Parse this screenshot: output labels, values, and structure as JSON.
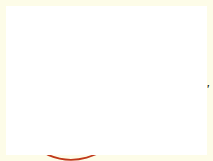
{
  "figure": {
    "kind": "geometry-diagram",
    "background_color": "#ffffff",
    "frame_color": "#fdfce8"
  },
  "colors": {
    "axis": "#9a9a9a",
    "black_line": "#1a1a1a",
    "red_line": "#d6431a",
    "triangle_fill": "#bdd9ef",
    "hatch_fill": "#f6d5cb",
    "hatch_stroke": "#d6431a",
    "arrow_blue": "#2b3a8f",
    "label_black": "#111111",
    "label_red": "#d6431a"
  },
  "points": {
    "A": {
      "label": "A",
      "x": 62,
      "y": 92
    },
    "B": {
      "label": "B",
      "x": 140,
      "y": 16
    },
    "Bprime": {
      "label": "B'",
      "x": 196,
      "y": 84
    },
    "Aprime": {
      "label": "A'",
      "x": 115,
      "y": 145
    }
  },
  "angle_labels": [
    {
      "name": "alpha-upper-left",
      "text": "α",
      "x": 60,
      "y": 48
    },
    {
      "name": "alpha-triangle",
      "text": "α",
      "x": 101,
      "y": 74
    },
    {
      "name": "beta-lower-left",
      "text": "β",
      "x": 79,
      "y": 122
    },
    {
      "name": "beta-right",
      "text": "β",
      "x": 158,
      "y": 92
    }
  ],
  "red_annotation": {
    "name": "red-handwritten-note",
    "text": "νε",
    "x": 92,
    "y": 102
  },
  "markers": {
    "right_angle_A": "right-angle-square-at-A",
    "right_angle_B": "right-angle-dot-at-B",
    "right_angle_Bprime": "right-angle-mark-at-B-prime"
  },
  "arc": {
    "name": "rotation-arc",
    "center": "A",
    "radius": 58,
    "color": "#d6431a"
  }
}
